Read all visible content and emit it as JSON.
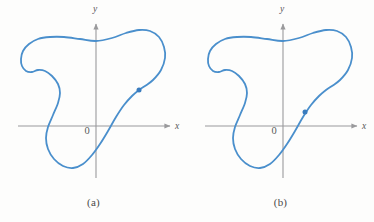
{
  "figure": {
    "type": "math-illustration",
    "background_color": "#fdfdfc",
    "width": 374,
    "height": 222
  },
  "style": {
    "curve_color": "#4a8fcc",
    "curve_width": 1.8,
    "axis_color": "#9a9a9c",
    "axis_width": 1.1,
    "label_color": "#58585a",
    "marker_color": "#3a7cbe"
  },
  "chart_data": {
    "type": "line",
    "title": "",
    "xlabel": "x",
    "ylabel": "y",
    "grid": false,
    "legend": null,
    "panels": [
      {
        "id": "a",
        "caption": "(a)",
        "axes": {
          "x_label": "x",
          "y_label": "y",
          "origin_label": "0",
          "origin_px": [
            96,
            126
          ],
          "x_axis_from_px": [
            18,
            126
          ],
          "x_axis_to_px": [
            172,
            126
          ],
          "y_axis_from_px": [
            96,
            178
          ],
          "y_axis_to_px": [
            96,
            22
          ],
          "x_label_px": [
            177,
            129
          ],
          "y_label_px": [
            95,
            12
          ],
          "origin_label_px": [
            87,
            134
          ]
        },
        "curve_points_px": [
          [
            96,
            41
          ],
          [
            112,
            38
          ],
          [
            126,
            33
          ],
          [
            139,
            30
          ],
          [
            150,
            31
          ],
          [
            159,
            37
          ],
          [
            164,
            47
          ],
          [
            165,
            58
          ],
          [
            161,
            70
          ],
          [
            153,
            80
          ],
          [
            145,
            86
          ],
          [
            139,
            90
          ],
          [
            132,
            96
          ],
          [
            124,
            105
          ],
          [
            116,
            117
          ],
          [
            108,
            131
          ],
          [
            100,
            144
          ],
          [
            92,
            155
          ],
          [
            83,
            164
          ],
          [
            73,
            168
          ],
          [
            63,
            166
          ],
          [
            54,
            159
          ],
          [
            48,
            149
          ],
          [
            46,
            138
          ],
          [
            48,
            127
          ],
          [
            53,
            115
          ],
          [
            58,
            103
          ],
          [
            60,
            93
          ],
          [
            58,
            84
          ],
          [
            52,
            76
          ],
          [
            45,
            71
          ],
          [
            38,
            70
          ],
          [
            32,
            72
          ],
          [
            26,
            71
          ],
          [
            22,
            66
          ],
          [
            21,
            59
          ],
          [
            23,
            51
          ],
          [
            29,
            44
          ],
          [
            38,
            39
          ],
          [
            50,
            37
          ],
          [
            64,
            37
          ],
          [
            80,
            39
          ],
          [
            96,
            41
          ]
        ],
        "marker": {
          "label": "point on curve",
          "px": [
            139,
            90
          ]
        }
      },
      {
        "id": "b",
        "caption": "(b)",
        "axes": {
          "x_label": "x",
          "y_label": "y",
          "origin_label": "0",
          "origin_px": [
            96,
            126
          ],
          "x_axis_from_px": [
            18,
            126
          ],
          "x_axis_to_px": [
            172,
            126
          ],
          "y_axis_from_px": [
            96,
            178
          ],
          "y_axis_to_px": [
            96,
            22
          ],
          "x_label_px": [
            177,
            129
          ],
          "y_label_px": [
            95,
            12
          ],
          "origin_label_px": [
            87,
            134
          ]
        },
        "curve_points_px": [
          [
            96,
            41
          ],
          [
            112,
            38
          ],
          [
            126,
            33
          ],
          [
            139,
            30
          ],
          [
            150,
            31
          ],
          [
            159,
            37
          ],
          [
            164,
            47
          ],
          [
            165,
            58
          ],
          [
            161,
            70
          ],
          [
            153,
            80
          ],
          [
            145,
            86
          ],
          [
            139,
            90
          ],
          [
            132,
            96
          ],
          [
            124,
            105
          ],
          [
            116,
            117
          ],
          [
            108,
            131
          ],
          [
            100,
            144
          ],
          [
            92,
            155
          ],
          [
            83,
            164
          ],
          [
            73,
            168
          ],
          [
            63,
            166
          ],
          [
            54,
            159
          ],
          [
            48,
            149
          ],
          [
            46,
            138
          ],
          [
            48,
            127
          ],
          [
            53,
            115
          ],
          [
            58,
            103
          ],
          [
            60,
            93
          ],
          [
            58,
            84
          ],
          [
            52,
            76
          ],
          [
            45,
            71
          ],
          [
            38,
            70
          ],
          [
            32,
            72
          ],
          [
            26,
            71
          ],
          [
            22,
            66
          ],
          [
            21,
            59
          ],
          [
            23,
            51
          ],
          [
            29,
            44
          ],
          [
            38,
            39
          ],
          [
            50,
            37
          ],
          [
            64,
            37
          ],
          [
            80,
            39
          ],
          [
            96,
            41
          ]
        ],
        "marker": {
          "label": "point on curve",
          "px": [
            118,
            112
          ]
        }
      }
    ]
  }
}
